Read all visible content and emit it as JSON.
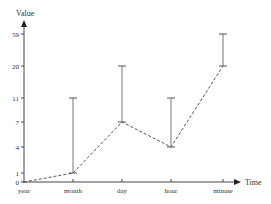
{
  "chart_data": {
    "type": "line",
    "title": "",
    "xlabel": "Time",
    "ylabel": "Value",
    "categories": [
      "year",
      "month",
      "day",
      "hour",
      "minute"
    ],
    "y_tick_labels": [
      "0",
      "1",
      "4",
      "7",
      "11",
      "20",
      "59"
    ],
    "y_scale": "non-linear (ordinal tick spacing)",
    "series": [
      {
        "name": "Value",
        "style": "dashed",
        "values": [
          0,
          1,
          7,
          4,
          20
        ],
        "error_upper": [
          null,
          11,
          20,
          11,
          59
        ]
      }
    ],
    "grid": false,
    "legend": null
  },
  "colors": {
    "axis": "#444444",
    "line": "#555555",
    "errorbar": "#777777",
    "text": "#333333"
  }
}
